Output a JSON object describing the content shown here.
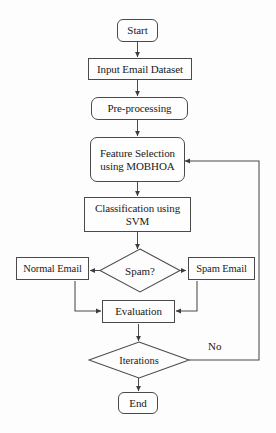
{
  "diagram": {
    "type": "flowchart",
    "background_color": "#fdfdfd",
    "line_color": "#4a4a4a",
    "text_color": "#1a1a1a",
    "nodes": [
      {
        "id": "start",
        "label": "Start",
        "shape": "terminator"
      },
      {
        "id": "input",
        "label": "Input Email Dataset",
        "shape": "process"
      },
      {
        "id": "preprocess",
        "label": "Pre-processing",
        "shape": "rounded-process"
      },
      {
        "id": "feature",
        "label_line1": "Feature Selection",
        "label_line2": "using MOBHOA",
        "shape": "rounded-process"
      },
      {
        "id": "classify",
        "label_line1": "Classification using",
        "label_line2": "SVM",
        "shape": "process"
      },
      {
        "id": "spam",
        "label": "Spam?",
        "shape": "decision"
      },
      {
        "id": "normal",
        "label": "Normal Email",
        "shape": "process"
      },
      {
        "id": "spamemail",
        "label": "Spam Email",
        "shape": "process"
      },
      {
        "id": "evaluation",
        "label": "Evaluation",
        "shape": "process"
      },
      {
        "id": "iterations",
        "label": "Iterations",
        "shape": "decision"
      },
      {
        "id": "end",
        "label": "End",
        "shape": "terminator"
      }
    ],
    "edge_labels": [
      {
        "id": "no-branch",
        "label": "No"
      }
    ]
  }
}
